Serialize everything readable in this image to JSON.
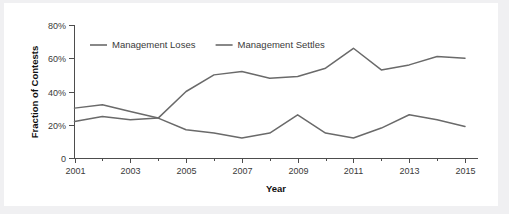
{
  "chart_data": {
    "type": "line",
    "title": "",
    "xlabel": "Year",
    "ylabel": "Fraction of Contests",
    "xlim": [
      2001,
      2015
    ],
    "ylim": [
      0,
      80
    ],
    "grid": false,
    "legend_position": "top-left-inside",
    "x": [
      2001,
      2002,
      2003,
      2004,
      2005,
      2006,
      2007,
      2008,
      2009,
      2010,
      2011,
      2012,
      2013,
      2014,
      2015
    ],
    "xticklabels": [
      "2001",
      "2003",
      "2005",
      "2007",
      "2009",
      "2011",
      "2013",
      "2015"
    ],
    "xtickvalues": [
      2001,
      2003,
      2005,
      2007,
      2009,
      2011,
      2013,
      2015
    ],
    "xminortickvalues": [
      2002,
      2004,
      2006,
      2008,
      2010,
      2012,
      2014
    ],
    "yticklabels": [
      "0",
      "20%",
      "40%",
      "60%",
      "80%"
    ],
    "ytickvalues": [
      0,
      20,
      40,
      60,
      80
    ],
    "series": [
      {
        "name": "Management Loses",
        "color": "#6a6a6a",
        "values": [
          30,
          32,
          28,
          24,
          17,
          15,
          12,
          15,
          26,
          15,
          12,
          18,
          26,
          23,
          19
        ]
      },
      {
        "name": "Management Settles",
        "color": "#6a6a6a",
        "values": [
          22,
          25,
          23,
          24,
          40,
          50,
          52,
          48,
          49,
          54,
          66,
          53,
          56,
          61,
          60
        ]
      }
    ]
  },
  "legend": {
    "items": [
      {
        "label": "Management Loses"
      },
      {
        "label": "Management Settles"
      }
    ]
  },
  "axes": {
    "y_title": "Fraction of Contests",
    "x_title": "Year"
  }
}
